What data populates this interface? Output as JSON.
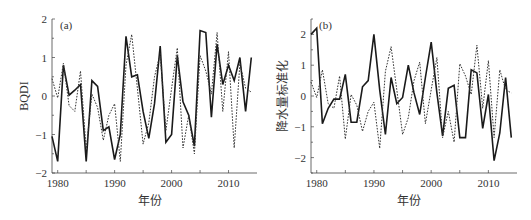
{
  "chart_data": [
    {
      "type": "line",
      "panel_label": "(a)",
      "title": "",
      "xlabel": "年份",
      "ylabel": "BQDI",
      "xlim": [
        1979,
        2015
      ],
      "ylim": [
        -2,
        2
      ],
      "xticks": [
        1980,
        1990,
        2000,
        2010
      ],
      "xticks_minor": [
        1985,
        1995,
        2005
      ],
      "yticks": [
        -2,
        -1,
        0,
        1,
        2
      ],
      "grid": false,
      "x": [
        1979,
        1980,
        1981,
        1982,
        1983,
        1984,
        1985,
        1986,
        1987,
        1988,
        1989,
        1990,
        1991,
        1992,
        1993,
        1994,
        1995,
        1996,
        1997,
        1998,
        1999,
        2000,
        2001,
        2002,
        2003,
        2004,
        2005,
        2006,
        2007,
        2008,
        2009,
        2010,
        2011,
        2012,
        2013,
        2014
      ],
      "series": [
        {
          "name": "solid",
          "style": "solid",
          "values": [
            -1.05,
            -1.7,
            0.8,
            0.02,
            0.15,
            0.3,
            -1.7,
            0.4,
            0.25,
            -0.9,
            -0.8,
            -1.65,
            -1.0,
            1.55,
            0.5,
            0.55,
            -0.4,
            -1.1,
            -0.2,
            1.3,
            -1.2,
            -1.0,
            1.05,
            -0.15,
            -0.5,
            -1.3,
            1.7,
            1.65,
            -0.55,
            1.35,
            0.3,
            0.8,
            0.4,
            1.0,
            -0.4,
            1.0
          ]
        },
        {
          "name": "dashed",
          "style": "dashed",
          "values": [
            0.45,
            -0.05,
            0.85,
            -0.25,
            -0.4,
            0.65,
            -1.4,
            0.05,
            -0.3,
            -1.15,
            -0.5,
            -0.2,
            -1.7,
            0.8,
            1.6,
            0.2,
            -1.25,
            -0.7,
            0.5,
            1.1,
            -0.9,
            0.2,
            1.25,
            -1.35,
            -0.5,
            -1.5,
            1.05,
            0.65,
            0.05,
            1.65,
            -0.4,
            1.15,
            -1.35,
            0.85,
            0.2,
            0.1
          ]
        }
      ]
    },
    {
      "type": "line",
      "panel_label": "(b)",
      "title": "",
      "xlabel": "年份",
      "ylabel": "降水量标准化",
      "xlim": [
        1979,
        2015
      ],
      "ylim": [
        -2.5,
        2.5
      ],
      "xticks": [
        1980,
        1990,
        2000,
        2010
      ],
      "xticks_minor": [
        1985,
        1995,
        2005
      ],
      "yticks": [
        -2,
        -1,
        0,
        1,
        2
      ],
      "grid": false,
      "x": [
        1979,
        1980,
        1981,
        1982,
        1983,
        1984,
        1985,
        1986,
        1987,
        1988,
        1989,
        1990,
        1991,
        1992,
        1993,
        1994,
        1995,
        1996,
        1997,
        1998,
        1999,
        2000,
        2001,
        2002,
        2003,
        2004,
        2005,
        2006,
        2007,
        2008,
        2009,
        2010,
        2011,
        2012,
        2013,
        2014
      ],
      "series": [
        {
          "name": "solid",
          "style": "solid",
          "values": [
            2.0,
            2.2,
            -0.9,
            -0.4,
            -0.1,
            -0.1,
            0.7,
            -0.85,
            -0.85,
            0.3,
            0.5,
            2.0,
            0.2,
            -1.25,
            0.6,
            -0.25,
            -0.05,
            1.0,
            0.1,
            -0.6,
            0.6,
            1.75,
            0.1,
            -1.3,
            0.25,
            0.35,
            -1.35,
            -1.35,
            0.85,
            0.75,
            -1.05,
            0.05,
            -2.1,
            -1.2,
            0.6,
            -1.35
          ]
        },
        {
          "name": "dashed",
          "style": "dashed",
          "values": [
            0.45,
            -0.05,
            0.85,
            -0.25,
            -0.4,
            0.65,
            -1.4,
            0.05,
            -0.3,
            -1.15,
            -0.5,
            -0.2,
            -1.7,
            0.8,
            1.6,
            0.2,
            -1.25,
            -0.7,
            0.5,
            1.1,
            -0.9,
            0.2,
            1.25,
            -1.35,
            -0.5,
            -1.5,
            1.05,
            0.65,
            0.05,
            1.65,
            -0.4,
            1.15,
            -1.35,
            0.85,
            0.2,
            0.1
          ]
        }
      ]
    }
  ],
  "style": {
    "line_color": "#1a1a1a",
    "axis_color": "#444444",
    "text_color": "#333333"
  },
  "panels_layout": [
    {
      "left": 52,
      "right": 257,
      "top": 19,
      "bottom": 173
    },
    {
      "left": 311,
      "right": 517,
      "top": 19,
      "bottom": 173
    }
  ]
}
